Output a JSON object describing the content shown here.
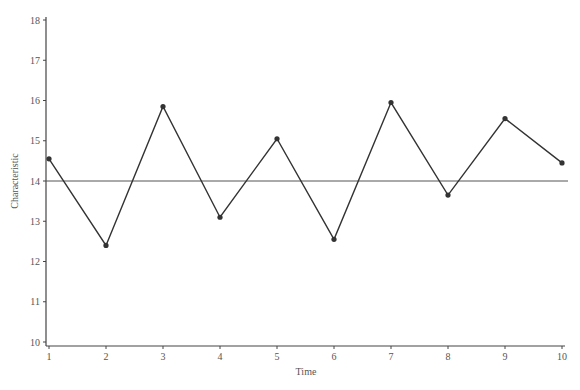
{
  "chart_data": {
    "type": "line",
    "title": "",
    "xlabel": "Time",
    "ylabel": "Characteristic",
    "x": [
      1,
      2,
      3,
      4,
      5,
      6,
      7,
      8,
      9,
      10
    ],
    "series": [
      {
        "name": "Characteristic",
        "values": [
          14.55,
          12.4,
          15.85,
          13.1,
          15.05,
          12.55,
          15.95,
          13.65,
          15.55,
          14.45
        ]
      }
    ],
    "reference_line": {
      "y": 14,
      "label": "center line"
    },
    "xlim": [
      1,
      10
    ],
    "ylim": [
      10,
      18
    ],
    "x_ticks": [
      "1",
      "2",
      "3",
      "4",
      "5",
      "6",
      "7",
      "8",
      "9",
      "10"
    ],
    "y_ticks": [
      "10",
      "11",
      "12",
      "13",
      "14",
      "15",
      "16",
      "17",
      "18"
    ],
    "grid": false,
    "legend": "none",
    "colors": {
      "line": "#333333",
      "axis": "#444444",
      "text": "#555555"
    }
  }
}
